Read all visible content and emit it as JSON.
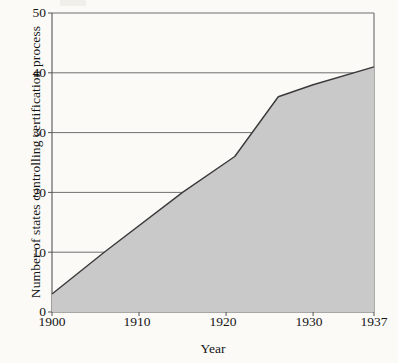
{
  "chart_data": {
    "type": "area",
    "title": "",
    "xlabel": "Year",
    "ylabel": "Number of states controlling certification process",
    "xlim": [
      1900,
      1937
    ],
    "ylim": [
      0,
      50
    ],
    "xticks": [
      1900,
      1910,
      1920,
      1930,
      1937
    ],
    "yticks": [
      0,
      10,
      20,
      30,
      40,
      50
    ],
    "grid": "horizontal",
    "legend": "none",
    "fill_color": "#c9c9c9",
    "line_color": "#3a3a3a",
    "series": [
      {
        "name": "States controlling certification process",
        "x": [
          1900,
          1906,
          1915,
          1921,
          1926,
          1930,
          1937
        ],
        "values": [
          3,
          10,
          20,
          26,
          36,
          38,
          41
        ]
      }
    ],
    "points": [
      {
        "x": 1900,
        "y": 3
      },
      {
        "x": 1906,
        "y": 10
      },
      {
        "x": 1915,
        "y": 20
      },
      {
        "x": 1921,
        "y": 26
      },
      {
        "x": 1926,
        "y": 36
      },
      {
        "x": 1930,
        "y": 38
      },
      {
        "x": 1937,
        "y": 41
      }
    ]
  },
  "axis": {
    "y_label": "Number of states controlling certification process",
    "x_label": "Year",
    "y_tick_labels": [
      "50",
      "40",
      "30",
      "20",
      "10",
      "0"
    ],
    "x_tick_labels": [
      "1900",
      "1910",
      "1920",
      "1930",
      "1937"
    ]
  }
}
